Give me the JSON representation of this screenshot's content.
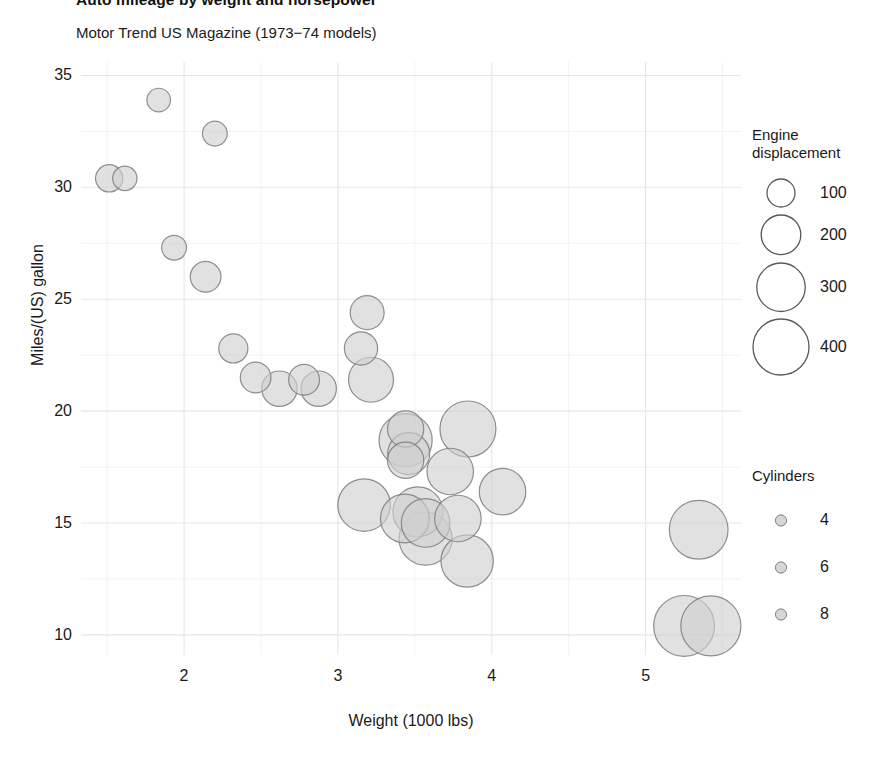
{
  "chart_data": {
    "type": "scatter",
    "title": "Auto mileage by weight and horsepower",
    "subtitle": "Motor Trend US Magazine (1973−74 models)",
    "xlabel": "Weight (1000 lbs)",
    "ylabel": "Miles/(US) gallon",
    "xlim": [
      1.33,
      5.62
    ],
    "ylim": [
      9.1,
      35.6
    ],
    "xticks": [
      2,
      3,
      4,
      5
    ],
    "yticks": [
      35,
      30,
      25,
      20,
      15,
      10
    ],
    "grid": true,
    "background": "#ffffff",
    "gridline_color": "#ebebeb",
    "bubble_fill": "#cfcfcf",
    "bubble_stroke": "#7d7d7d",
    "bubble_opacity": 0.62,
    "size_encoding": "Engine displacement",
    "color_encoding": "Cylinders",
    "points": [
      {
        "label": "Toyota Corolla",
        "x": 1.835,
        "y": 33.9,
        "size": 71.1,
        "cyl": 4
      },
      {
        "label": "Fiat 128",
        "x": 2.2,
        "y": 32.4,
        "size": 78.7,
        "cyl": 4
      },
      {
        "label": "Honda Civic",
        "x": 1.615,
        "y": 30.4,
        "size": 75.7,
        "cyl": 4
      },
      {
        "label": "Lotus Europa",
        "x": 1.513,
        "y": 30.4,
        "size": 95.1,
        "cyl": 4
      },
      {
        "label": "Fiat X1-9",
        "x": 1.935,
        "y": 27.3,
        "size": 79.0,
        "cyl": 4
      },
      {
        "label": "Porsche 914-2",
        "x": 2.14,
        "y": 26.0,
        "size": 120.3,
        "cyl": 4
      },
      {
        "label": "Merc 240D",
        "x": 3.19,
        "y": 24.4,
        "size": 146.7,
        "cyl": 4
      },
      {
        "label": "Datsun 710",
        "x": 2.32,
        "y": 22.8,
        "size": 108.0,
        "cyl": 4
      },
      {
        "label": "Merc 230",
        "x": 3.15,
        "y": 22.8,
        "size": 140.8,
        "cyl": 4
      },
      {
        "label": "Toyota Corona",
        "x": 2.465,
        "y": 21.5,
        "size": 120.1,
        "cyl": 4
      },
      {
        "label": "Mazda RX4",
        "x": 2.62,
        "y": 21.0,
        "size": 160.0,
        "cyl": 6
      },
      {
        "label": "Mazda RX4 Wag",
        "x": 2.875,
        "y": 21.0,
        "size": 160.0,
        "cyl": 6
      },
      {
        "label": "Volvo 142E",
        "x": 2.78,
        "y": 21.4,
        "size": 121.0,
        "cyl": 4
      },
      {
        "label": "Hornet 4 Drive",
        "x": 3.215,
        "y": 21.4,
        "size": 258.0,
        "cyl": 6
      },
      {
        "label": "Merc 280",
        "x": 3.44,
        "y": 19.2,
        "size": 167.6,
        "cyl": 6
      },
      {
        "label": "Pontiac Firebird",
        "x": 3.845,
        "y": 19.2,
        "size": 400.0,
        "cyl": 8
      },
      {
        "label": "Merc 280C",
        "x": 3.44,
        "y": 17.8,
        "size": 167.6,
        "cyl": 6
      },
      {
        "label": "Hornet Sportabout",
        "x": 3.44,
        "y": 18.7,
        "size": 360.0,
        "cyl": 8
      },
      {
        "label": "Valiant",
        "x": 3.46,
        "y": 18.1,
        "size": 225.0,
        "cyl": 6
      },
      {
        "label": "Merc 450SL",
        "x": 3.73,
        "y": 17.3,
        "size": 275.8,
        "cyl": 8
      },
      {
        "label": "Merc 450SE",
        "x": 4.07,
        "y": 16.4,
        "size": 275.8,
        "cyl": 8
      },
      {
        "label": "Merc 450SLC",
        "x": 3.78,
        "y": 15.2,
        "size": 275.8,
        "cyl": 8
      },
      {
        "label": "Ford Pantera L",
        "x": 3.17,
        "y": 15.8,
        "size": 351.0,
        "cyl": 8
      },
      {
        "label": "Dodge Challenger",
        "x": 3.52,
        "y": 15.5,
        "size": 318.0,
        "cyl": 8
      },
      {
        "label": "AMC Javelin",
        "x": 3.435,
        "y": 15.2,
        "size": 304.0,
        "cyl": 8
      },
      {
        "label": "Maserati Bora",
        "x": 3.57,
        "y": 15.0,
        "size": 301.0,
        "cyl": 8
      },
      {
        "label": "Camaro Z28",
        "x": 3.84,
        "y": 13.3,
        "size": 350.0,
        "cyl": 8
      },
      {
        "label": "Duster 360",
        "x": 3.57,
        "y": 14.3,
        "size": 360.0,
        "cyl": 8
      },
      {
        "label": "Chrysler Imperial",
        "x": 5.345,
        "y": 14.7,
        "size": 440.0,
        "cyl": 8
      },
      {
        "label": "Cadillac Fleetwood",
        "x": 5.25,
        "y": 10.4,
        "size": 472.0,
        "cyl": 8
      },
      {
        "label": "Lincoln Continental",
        "x": 5.424,
        "y": 10.4,
        "size": 460.0,
        "cyl": 8
      }
    ]
  },
  "size_legend": {
    "title_line1": "Engine",
    "title_line2": "displacement",
    "items": [
      {
        "label": "100",
        "value": 100
      },
      {
        "label": "200",
        "value": 200
      },
      {
        "label": "300",
        "value": 300
      },
      {
        "label": "400",
        "value": 400
      }
    ]
  },
  "color_legend": {
    "title": "Cylinders",
    "items": [
      {
        "label": "4",
        "value": 4
      },
      {
        "label": "6",
        "value": 6
      },
      {
        "label": "8",
        "value": 8
      }
    ]
  }
}
